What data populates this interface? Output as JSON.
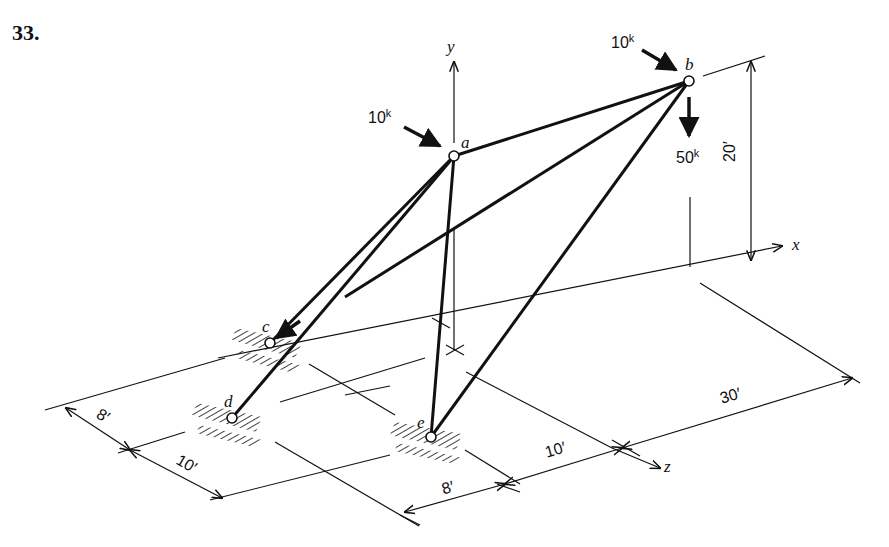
{
  "problem": {
    "number": "33."
  },
  "axes": {
    "x": "x",
    "y": "y",
    "z": "z"
  },
  "nodes": {
    "a": "a",
    "b": "b",
    "c": "c",
    "d": "d",
    "e": "e"
  },
  "loads": {
    "a_horizontal": {
      "value": "10",
      "unit": "k"
    },
    "b_horizontal": {
      "value": "10",
      "unit": "k"
    },
    "b_vertical": {
      "value": "50",
      "unit": "k"
    }
  },
  "dimensions": {
    "height": "20′",
    "left_8": "8′",
    "left_10": "10′",
    "bottom_8": "8′",
    "bottom_10": "10′",
    "right_30": "30′"
  }
}
